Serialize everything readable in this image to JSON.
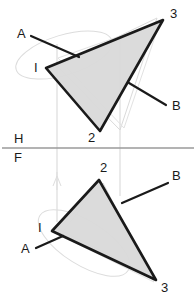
{
  "drawing": {
    "title": "Descriptive geometry two-view projection of a triangle",
    "colors": {
      "ink": "#1a1a1a",
      "fill": "#d9d9d9",
      "construction": "#cfcfcf",
      "fold_line": "#9a9a9a",
      "background": "#ffffff"
    },
    "fold_line": {
      "label_upper": "H",
      "label_lower": "F",
      "y": 148,
      "x_start": 2,
      "x_end": 194
    },
    "views": [
      {
        "name": "horizontal-view",
        "plane_label": "H",
        "triangle": {
          "points": "46,68 163,20 100,131",
          "vertices": [
            {
              "id": "v1",
              "label": "I",
              "x": 46,
              "y": 68,
              "label_x": 34,
              "label_y": 72
            },
            {
              "id": "v3",
              "label": "3",
              "x": 163,
              "y": 20,
              "label_x": 170,
              "label_y": 18
            },
            {
              "id": "v2",
              "label": "2",
              "x": 100,
              "y": 131,
              "label_x": 88,
              "label_y": 142
            }
          ]
        },
        "leaders": [
          {
            "id": "leader-a-h",
            "label": "A",
            "x1": 31,
            "y1": 36,
            "x2": 79,
            "y2": 57,
            "label_x": 17,
            "label_y": 38
          },
          {
            "id": "leader-b-h",
            "label": "B",
            "x1": 129,
            "y1": 83,
            "x2": 166,
            "y2": 105,
            "label_x": 172,
            "label_y": 110
          }
        ],
        "construction": {
          "ellipse": {
            "cx": 64,
            "cy": 55,
            "rx": 50,
            "ry": 20,
            "rotate": -17
          },
          "ghost_polygon": "57,66 157,18 120,130",
          "extra_polygon": "58,58 160,22 124,128"
        }
      },
      {
        "name": "frontal-view",
        "plane_label": "F",
        "triangle": {
          "points": "52,231 99,180 156,280",
          "vertices": [
            {
              "id": "v1",
              "label": "I",
              "x": 52,
              "y": 231,
              "label_x": 38,
              "label_y": 232
            },
            {
              "id": "v2",
              "label": "2",
              "x": 99,
              "y": 180,
              "label_x": 100,
              "label_y": 172
            },
            {
              "id": "v3",
              "label": "3",
              "x": 156,
              "y": 280,
              "label_x": 161,
              "label_y": 292
            }
          ]
        },
        "leaders": [
          {
            "id": "leader-a-f",
            "label": "A",
            "x1": 36,
            "y1": 248,
            "x2": 63,
            "y2": 236,
            "label_x": 21,
            "label_y": 253
          },
          {
            "id": "leader-b-f",
            "label": "B",
            "x1": 122,
            "y1": 203,
            "x2": 168,
            "y2": 183,
            "label_x": 172,
            "label_y": 180
          }
        ],
        "construction": {
          "ellipse": {
            "cx": 84,
            "cy": 243,
            "rx": 52,
            "ry": 22,
            "rotate": 32
          },
          "ghost_polygon": "58,229 103,183 151,276",
          "extra_polygon": "60,235 99,186 154,282"
        }
      }
    ],
    "projectors": [
      {
        "id": "projector-left",
        "x": 57,
        "y1": 44,
        "y2": 222
      },
      {
        "id": "projector-right",
        "x": 120,
        "y1": 36,
        "y2": 196
      }
    ]
  }
}
